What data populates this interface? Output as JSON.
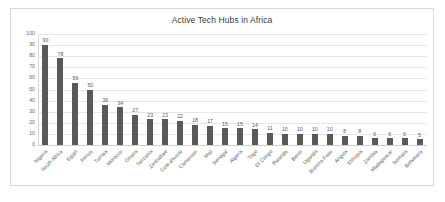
{
  "chart_data": {
    "type": "bar",
    "title": "Active Tech Hubs in Africa",
    "xlabel": "",
    "ylabel": "",
    "ylim": [
      0,
      100
    ],
    "ytick_step": 10,
    "yticks": [
      100,
      90,
      80,
      70,
      60,
      50,
      40,
      30,
      20,
      10,
      0
    ],
    "grid": true,
    "legend": false,
    "data_labels": true,
    "bar_color": "#595959",
    "categories": [
      "Nigeria",
      "South Africa",
      "Egypt",
      "Kenya",
      "Tunisia",
      "Morocco",
      "Ghana",
      "Tanzania",
      "Zimbabwe",
      "Cote d'Ivoire",
      "Cameroon",
      "Mali",
      "Senegal",
      "Algeria",
      "Togo",
      "Dr Congo",
      "Rwanda",
      "Benin",
      "Uganda",
      "Burkina Faso",
      "Angola",
      "Ethiopia",
      "Zambia",
      "Madagascar",
      "Somalia",
      "Botswana"
    ],
    "values": [
      90,
      78,
      56,
      50,
      36,
      34,
      27,
      23,
      23,
      22,
      18,
      17,
      15,
      15,
      14,
      11,
      10,
      10,
      10,
      10,
      8,
      8,
      6,
      6,
      6,
      5
    ]
  }
}
